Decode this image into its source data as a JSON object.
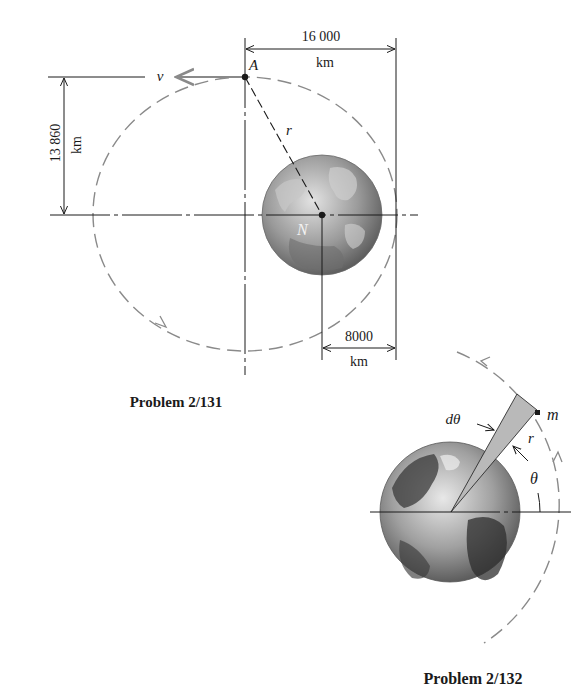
{
  "figures": [
    {
      "caption": "Problem 2/131",
      "labels": {
        "point_A": "A",
        "velocity": "v",
        "radius": "r",
        "earth_pole": "N"
      },
      "dimensions": {
        "horizontal_top": {
          "value": "16 000",
          "unit": "km"
        },
        "vertical_left": {
          "value": "13 860",
          "unit": "km"
        },
        "horizontal_bottom": {
          "value": "8000",
          "unit": "km"
        }
      }
    },
    {
      "caption": "Problem 2/132",
      "labels": {
        "mass": "m",
        "radius": "r",
        "angle": "θ",
        "angle_increment": "dθ"
      }
    }
  ],
  "colors": {
    "line": "#1a1a1a",
    "orbit_dash": "#8a8a8a",
    "wedge_fill": "#b9b9b9",
    "earth_light": "#d6d6d6",
    "earth_dark": "#4a4a4a"
  }
}
